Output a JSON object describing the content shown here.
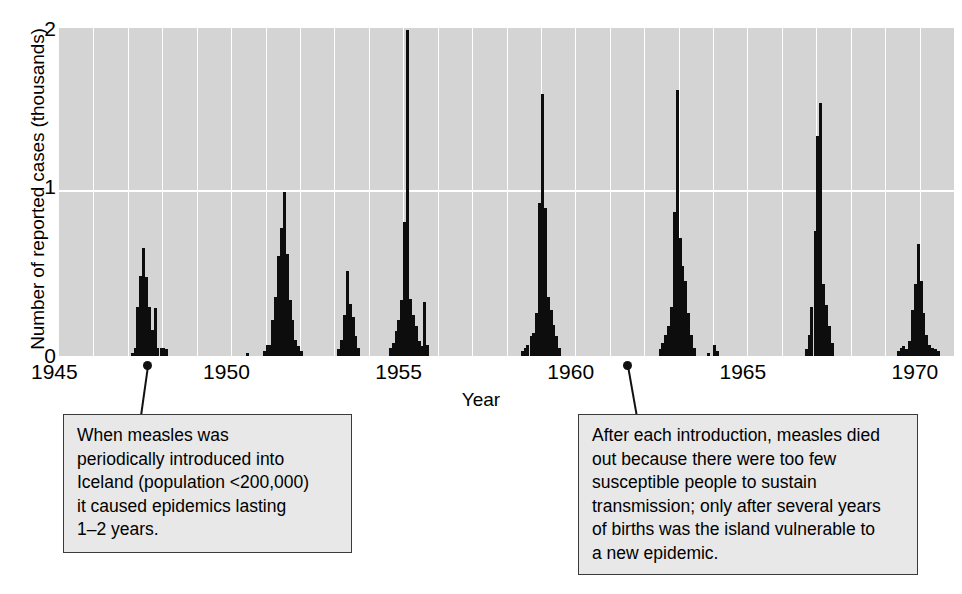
{
  "chart_data": {
    "type": "bar",
    "title": "",
    "subtitle": "",
    "xlabel": "Year",
    "ylabel": "Number of reported cases (thousands)",
    "xlim": [
      1945,
      1971
    ],
    "ylim": [
      0,
      2
    ],
    "x_ticks": [
      "1945",
      "1950",
      "1955",
      "1960",
      "1965",
      "1970"
    ],
    "x_tick_values": [
      1945,
      1950,
      1955,
      1960,
      1965,
      1970
    ],
    "y_ticks": [
      "0",
      "1",
      "2"
    ],
    "y_tick_values": [
      0,
      1,
      2
    ],
    "grid": "vertical gridlines each year, horizontal gridline at y=1",
    "legend": "none",
    "bin_width_years": 0.0833,
    "units": "thousands of reported measles cases per month",
    "plot_background": "#d4d4d4",
    "bar_color": "#0d0d0d",
    "gridline_color": "#ffffff",
    "series": [
      {
        "name": "Reported measles cases in Iceland",
        "points": [
          {
            "x": 1947.08,
            "y": 0.02
          },
          {
            "x": 1947.17,
            "y": 0.05
          },
          {
            "x": 1947.25,
            "y": 0.3
          },
          {
            "x": 1947.33,
            "y": 0.49
          },
          {
            "x": 1947.42,
            "y": 0.66
          },
          {
            "x": 1947.5,
            "y": 0.48
          },
          {
            "x": 1947.58,
            "y": 0.3
          },
          {
            "x": 1947.67,
            "y": 0.16
          },
          {
            "x": 1947.75,
            "y": 0.29
          },
          {
            "x": 1947.83,
            "y": 0.05
          },
          {
            "x": 1947.92,
            "y": 0.05
          },
          {
            "x": 1948.0,
            "y": 0.05
          },
          {
            "x": 1948.08,
            "y": 0.04
          },
          {
            "x": 1950.42,
            "y": 0.02
          },
          {
            "x": 1950.92,
            "y": 0.03
          },
          {
            "x": 1951.0,
            "y": 0.07
          },
          {
            "x": 1951.08,
            "y": 0.07
          },
          {
            "x": 1951.17,
            "y": 0.22
          },
          {
            "x": 1951.25,
            "y": 0.36
          },
          {
            "x": 1951.33,
            "y": 0.61
          },
          {
            "x": 1951.42,
            "y": 0.78
          },
          {
            "x": 1951.5,
            "y": 1.0
          },
          {
            "x": 1951.58,
            "y": 0.62
          },
          {
            "x": 1951.67,
            "y": 0.34
          },
          {
            "x": 1951.75,
            "y": 0.22
          },
          {
            "x": 1951.83,
            "y": 0.1
          },
          {
            "x": 1951.92,
            "y": 0.06
          },
          {
            "x": 1952.0,
            "y": 0.03
          },
          {
            "x": 1953.08,
            "y": 0.04
          },
          {
            "x": 1953.17,
            "y": 0.1
          },
          {
            "x": 1953.25,
            "y": 0.25
          },
          {
            "x": 1953.33,
            "y": 0.52
          },
          {
            "x": 1953.42,
            "y": 0.32
          },
          {
            "x": 1953.5,
            "y": 0.24
          },
          {
            "x": 1953.58,
            "y": 0.12
          },
          {
            "x": 1953.67,
            "y": 0.05
          },
          {
            "x": 1954.58,
            "y": 0.05
          },
          {
            "x": 1954.67,
            "y": 0.08
          },
          {
            "x": 1954.75,
            "y": 0.15
          },
          {
            "x": 1954.83,
            "y": 0.22
          },
          {
            "x": 1954.92,
            "y": 0.34
          },
          {
            "x": 1955.0,
            "y": 0.82
          },
          {
            "x": 1955.08,
            "y": 1.99
          },
          {
            "x": 1955.17,
            "y": 0.35
          },
          {
            "x": 1955.25,
            "y": 0.25
          },
          {
            "x": 1955.33,
            "y": 0.18
          },
          {
            "x": 1955.42,
            "y": 0.09
          },
          {
            "x": 1955.5,
            "y": 0.06
          },
          {
            "x": 1955.58,
            "y": 0.33
          },
          {
            "x": 1955.67,
            "y": 0.07
          },
          {
            "x": 1958.42,
            "y": 0.03
          },
          {
            "x": 1958.5,
            "y": 0.05
          },
          {
            "x": 1958.58,
            "y": 0.07
          },
          {
            "x": 1958.67,
            "y": 0.12
          },
          {
            "x": 1958.75,
            "y": 0.14
          },
          {
            "x": 1958.83,
            "y": 0.26
          },
          {
            "x": 1958.92,
            "y": 0.93
          },
          {
            "x": 1959.0,
            "y": 1.6
          },
          {
            "x": 1959.08,
            "y": 0.9
          },
          {
            "x": 1959.17,
            "y": 0.36
          },
          {
            "x": 1959.25,
            "y": 0.28
          },
          {
            "x": 1959.33,
            "y": 0.19
          },
          {
            "x": 1959.42,
            "y": 0.12
          },
          {
            "x": 1959.5,
            "y": 0.05
          },
          {
            "x": 1962.42,
            "y": 0.04
          },
          {
            "x": 1962.5,
            "y": 0.08
          },
          {
            "x": 1962.58,
            "y": 0.13
          },
          {
            "x": 1962.67,
            "y": 0.18
          },
          {
            "x": 1962.75,
            "y": 0.3
          },
          {
            "x": 1962.83,
            "y": 0.88
          },
          {
            "x": 1962.92,
            "y": 1.62
          },
          {
            "x": 1963.0,
            "y": 0.72
          },
          {
            "x": 1963.08,
            "y": 0.55
          },
          {
            "x": 1963.17,
            "y": 0.46
          },
          {
            "x": 1963.25,
            "y": 0.26
          },
          {
            "x": 1963.33,
            "y": 0.13
          },
          {
            "x": 1963.42,
            "y": 0.05
          },
          {
            "x": 1963.83,
            "y": 0.02
          },
          {
            "x": 1964.0,
            "y": 0.07
          },
          {
            "x": 1964.08,
            "y": 0.03
          },
          {
            "x": 1966.67,
            "y": 0.04
          },
          {
            "x": 1966.75,
            "y": 0.13
          },
          {
            "x": 1966.83,
            "y": 0.3
          },
          {
            "x": 1966.92,
            "y": 0.76
          },
          {
            "x": 1967.0,
            "y": 1.34
          },
          {
            "x": 1967.08,
            "y": 1.54
          },
          {
            "x": 1967.17,
            "y": 0.44
          },
          {
            "x": 1967.25,
            "y": 0.31
          },
          {
            "x": 1967.33,
            "y": 0.18
          },
          {
            "x": 1967.42,
            "y": 0.08
          },
          {
            "x": 1969.33,
            "y": 0.03
          },
          {
            "x": 1969.42,
            "y": 0.05
          },
          {
            "x": 1969.5,
            "y": 0.06
          },
          {
            "x": 1969.58,
            "y": 0.04
          },
          {
            "x": 1969.67,
            "y": 0.09
          },
          {
            "x": 1969.75,
            "y": 0.28
          },
          {
            "x": 1969.83,
            "y": 0.44
          },
          {
            "x": 1969.92,
            "y": 0.68
          },
          {
            "x": 1970.0,
            "y": 0.46
          },
          {
            "x": 1970.08,
            "y": 0.26
          },
          {
            "x": 1970.17,
            "y": 0.13
          },
          {
            "x": 1970.25,
            "y": 0.07
          },
          {
            "x": 1970.33,
            "y": 0.05
          },
          {
            "x": 1970.42,
            "y": 0.04
          },
          {
            "x": 1970.5,
            "y": 0.03
          }
        ]
      }
    ]
  },
  "annotations": {
    "left": {
      "text": "When measles was\nperiodically introduced into\nIceland (population <200,000)\nit caused epidemics lasting\n1–2 years.",
      "points_to_year": 1948
    },
    "right": {
      "text": "After each introduction, measles died\nout because there were too few\nsusceptible people to sustain\ntransmission; only after several years\nof births was the island vulnerable to\na new epidemic.",
      "points_to_year": 1961
    }
  }
}
